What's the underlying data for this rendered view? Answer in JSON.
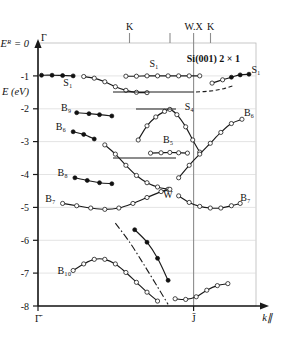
{
  "chart_data": {
    "type": "line",
    "title": "Si(001) 2 × 1",
    "xlabel": "k∥",
    "ylabel": "E (eV)",
    "ylim": [
      -8,
      0
    ],
    "xlim": [
      0,
      1.24
    ],
    "grid": true,
    "legend": "none",
    "y_ticks": [
      "-1",
      "-2",
      "-3",
      "-4",
      "-5",
      "-6",
      "-7",
      "-8"
    ],
    "y_tick_values": [
      -1,
      -2,
      -3,
      -4,
      -5,
      -6,
      -7,
      -8
    ],
    "fermi_label": "Eᴿ = 0",
    "x_tick_labels": [
      "Γ̄",
      "J̄"
    ],
    "x_tick_values": [
      0,
      1.0
    ],
    "top_axis_labels": [
      "Γ",
      "K",
      "W.X",
      "K"
    ],
    "top_axis_values": [
      0.0,
      0.52,
      0.75,
      0.98
    ],
    "series": [
      {
        "name": "S1-left",
        "label": "S₁",
        "marker": "filled",
        "points": [
          [
            0.02,
            -0.98
          ],
          [
            0.08,
            -0.98
          ],
          [
            0.14,
            -0.99
          ],
          [
            0.2,
            -1.0
          ]
        ]
      },
      {
        "name": "S1-dispersing",
        "label": "S₁",
        "marker": "open",
        "points": [
          [
            0.26,
            -1.02
          ],
          [
            0.32,
            -1.07
          ],
          [
            0.38,
            -1.18
          ],
          [
            0.44,
            -1.33
          ],
          [
            0.5,
            -1.44
          ],
          [
            0.56,
            -1.5
          ],
          [
            0.62,
            -1.51
          ]
        ]
      },
      {
        "name": "S1-flat-upper",
        "label": "S₁",
        "marker": "open",
        "points": [
          [
            0.5,
            -1.01
          ],
          [
            0.56,
            -1.01
          ],
          [
            0.62,
            -1.0
          ],
          [
            0.68,
            -1.0
          ],
          [
            0.74,
            -1.0
          ],
          [
            0.8,
            -1.0
          ],
          [
            0.86,
            -1.0
          ],
          [
            0.92,
            -1.0
          ]
        ]
      },
      {
        "name": "S1-right-rise",
        "label": "S₁",
        "marker": "mixed",
        "points": [
          [
            0.99,
            -1.22
          ],
          [
            1.05,
            -1.12
          ],
          [
            1.1,
            -1.04
          ],
          [
            1.15,
            -0.97
          ],
          [
            1.2,
            -0.95
          ]
        ]
      },
      {
        "name": "S4",
        "label": "S₄",
        "marker": "open",
        "points": [
          [
            0.57,
            -2.95
          ],
          [
            0.62,
            -2.52
          ],
          [
            0.67,
            -2.25
          ],
          [
            0.72,
            -2.08
          ],
          [
            0.75,
            -2.02
          ],
          [
            0.79,
            -2.18
          ],
          [
            0.84,
            -2.55
          ],
          [
            0.88,
            -2.95
          ],
          [
            0.92,
            -3.32
          ]
        ]
      },
      {
        "name": "B5",
        "label": "B₅",
        "marker": "open",
        "points": [
          [
            0.64,
            -3.35
          ],
          [
            0.7,
            -3.34
          ],
          [
            0.75,
            -3.33
          ],
          [
            0.8,
            -3.34
          ],
          [
            0.85,
            -3.35
          ]
        ]
      },
      {
        "name": "B9",
        "label": "B₉",
        "marker": "filled",
        "points": [
          [
            0.22,
            -2.12
          ],
          [
            0.29,
            -2.15
          ],
          [
            0.35,
            -2.18
          ],
          [
            0.42,
            -2.22
          ]
        ]
      },
      {
        "name": "B6-left",
        "label": "B₆",
        "marker": "filled",
        "points": [
          [
            0.2,
            -2.7
          ],
          [
            0.26,
            -2.78
          ],
          [
            0.32,
            -2.92
          ]
        ]
      },
      {
        "name": "B6-branch",
        "label": "B₆",
        "marker": "open",
        "points": [
          [
            0.38,
            -3.1
          ],
          [
            0.44,
            -3.38
          ],
          [
            0.5,
            -3.72
          ],
          [
            0.56,
            -4.03
          ],
          [
            0.62,
            -4.25
          ],
          [
            0.68,
            -4.38
          ],
          [
            0.74,
            -4.45
          ]
        ]
      },
      {
        "name": "B6-right",
        "label": "B₆",
        "marker": "open",
        "points": [
          [
            0.8,
            -4.1
          ],
          [
            0.86,
            -3.72
          ],
          [
            0.92,
            -3.38
          ],
          [
            0.98,
            -3.05
          ],
          [
            1.04,
            -2.72
          ],
          [
            1.1,
            -2.45
          ],
          [
            1.16,
            -2.32
          ]
        ]
      },
      {
        "name": "B8",
        "label": "B₈",
        "marker": "filled",
        "points": [
          [
            0.21,
            -4.1
          ],
          [
            0.28,
            -4.18
          ],
          [
            0.35,
            -4.25
          ],
          [
            0.42,
            -4.28
          ]
        ]
      },
      {
        "name": "B7-left",
        "label": "B₇",
        "marker": "open",
        "points": [
          [
            0.14,
            -4.88
          ],
          [
            0.22,
            -4.95
          ],
          [
            0.3,
            -5.02
          ],
          [
            0.38,
            -5.06
          ],
          [
            0.46,
            -5.02
          ],
          [
            0.54,
            -4.88
          ],
          [
            0.62,
            -4.7
          ],
          [
            0.7,
            -4.52
          ],
          [
            0.75,
            -4.45
          ]
        ]
      },
      {
        "name": "B7-right",
        "label": "B₇",
        "marker": "open",
        "points": [
          [
            0.8,
            -4.65
          ],
          [
            0.86,
            -4.85
          ],
          [
            0.92,
            -4.97
          ],
          [
            0.98,
            -5.02
          ],
          [
            1.04,
            -5.02
          ],
          [
            1.1,
            -4.95
          ],
          [
            1.15,
            -4.88
          ]
        ]
      },
      {
        "name": "B-steep-filled",
        "label": "",
        "marker": "filled",
        "points": [
          [
            0.55,
            -5.68
          ],
          [
            0.62,
            -6.06
          ],
          [
            0.68,
            -6.55
          ],
          [
            0.74,
            -7.22
          ]
        ]
      },
      {
        "name": "B-steep-dashdot",
        "label": "",
        "marker": "none",
        "points": [
          [
            0.44,
            -5.48
          ],
          [
            0.52,
            -6.05
          ],
          [
            0.6,
            -6.72
          ],
          [
            0.68,
            -7.42
          ],
          [
            0.74,
            -7.95
          ]
        ]
      },
      {
        "name": "B10",
        "label": "B₁₀",
        "marker": "open",
        "points": [
          [
            0.2,
            -6.92
          ],
          [
            0.26,
            -6.72
          ],
          [
            0.32,
            -6.58
          ],
          [
            0.38,
            -6.58
          ],
          [
            0.44,
            -6.72
          ],
          [
            0.5,
            -6.98
          ],
          [
            0.56,
            -7.28
          ],
          [
            0.62,
            -7.58
          ],
          [
            0.68,
            -7.85
          ]
        ]
      },
      {
        "name": "B10-bottom-right",
        "label": "",
        "marker": "open",
        "points": [
          [
            0.78,
            -7.78
          ],
          [
            0.84,
            -7.8
          ],
          [
            0.9,
            -7.72
          ],
          [
            0.96,
            -7.52
          ],
          [
            1.02,
            -7.38
          ],
          [
            1.08,
            -7.32
          ]
        ]
      }
    ],
    "annotations": [
      {
        "text": "S₁",
        "x": 0.17,
        "y": -1.3
      },
      {
        "text": "S₁",
        "x": 0.66,
        "y": -0.72
      },
      {
        "text": "S₁",
        "x": 1.24,
        "y": -0.92
      },
      {
        "text": "S₄",
        "x": 0.86,
        "y": -2.03
      },
      {
        "text": "B₉",
        "x": 0.16,
        "y": -2.06
      },
      {
        "text": "B₆",
        "x": 0.13,
        "y": -2.65
      },
      {
        "text": "B₅",
        "x": 0.74,
        "y": -3.05
      },
      {
        "text": "B₈",
        "x": 0.14,
        "y": -4.05
      },
      {
        "text": "B₇",
        "x": 0.07,
        "y": -4.84
      },
      {
        "text": "B₇",
        "x": 1.18,
        "y": -4.82
      },
      {
        "text": "B₆",
        "x": 1.2,
        "y": -2.22
      },
      {
        "text": "W",
        "x": 0.74,
        "y": -4.72
      },
      {
        "text": "B₁₀",
        "x": 0.15,
        "y": -7.02
      }
    ]
  }
}
